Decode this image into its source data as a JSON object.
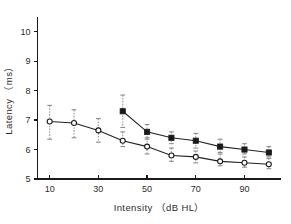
{
  "chart_data": {
    "type": "line",
    "title": "",
    "xlabel": "Intensity （dB HL）",
    "ylabel": "Latency （ms）",
    "x": [
      10,
      20,
      30,
      40,
      50,
      60,
      70,
      80,
      90,
      100
    ],
    "xlim": [
      5,
      105
    ],
    "ylim": [
      5,
      10.5
    ],
    "xticks": [
      10,
      30,
      50,
      70,
      90
    ],
    "xticklabels": [
      "10",
      "30",
      "50",
      "70",
      "90"
    ],
    "yticks": [
      5,
      6,
      7,
      8,
      9,
      10
    ],
    "yticklabels": [
      "5",
      "6",
      "7",
      "8",
      "9",
      "10"
    ],
    "grid": false,
    "legend": "none",
    "series": [
      {
        "name": "filled-square-series",
        "marker": "filled-square",
        "x": [
          40,
          50,
          60,
          70,
          80,
          90,
          100
        ],
        "values": [
          7.3,
          6.6,
          6.4,
          6.3,
          6.1,
          6.0,
          5.9
        ],
        "err_low": [
          6.75,
          6.35,
          6.2,
          6.05,
          5.9,
          5.85,
          5.75
        ],
        "err_high": [
          7.85,
          6.85,
          6.6,
          6.55,
          6.35,
          6.2,
          6.1
        ]
      },
      {
        "name": "open-circle-series",
        "marker": "open-circle",
        "x": [
          10,
          20,
          30,
          40,
          50,
          60,
          70,
          80,
          90,
          100
        ],
        "values": [
          6.95,
          6.9,
          6.65,
          6.3,
          6.1,
          5.8,
          5.75,
          5.6,
          5.55,
          5.5
        ],
        "err_low": [
          6.35,
          6.4,
          6.25,
          6.1,
          5.85,
          5.6,
          5.55,
          5.45,
          5.4,
          5.35
        ],
        "err_high": [
          7.5,
          7.35,
          7.05,
          6.6,
          6.4,
          6.05,
          5.95,
          5.85,
          5.75,
          5.7
        ]
      }
    ]
  },
  "axes": {
    "y_axis_name": "latency-axis",
    "x_axis_name": "intensity-axis"
  }
}
